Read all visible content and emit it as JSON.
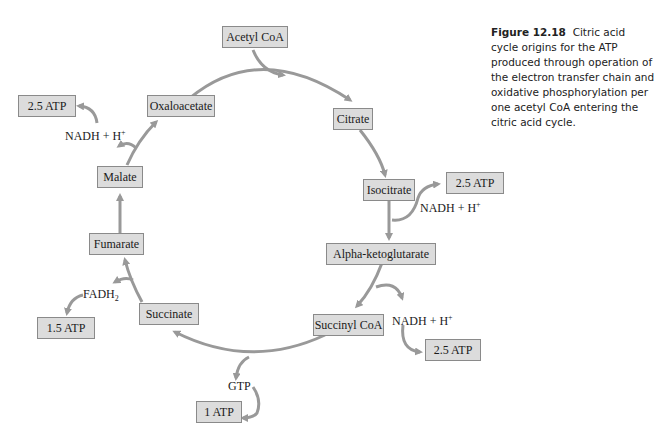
{
  "figure": {
    "number": "Figure 12.18",
    "caption": "Citric acid cycle origins for the ATP produced through operation of the electron transfer chain and oxidative phosphorylation per one acetyl CoA entering the citric acid cycle."
  },
  "cycle": {
    "entry": "Acetyl CoA",
    "intermediates": [
      "Citrate",
      "Isocitrate",
      "Alpha-ketoglutarate",
      "Succinyl CoA",
      "Succinate",
      "Fumarate",
      "Malate",
      "Oxaloacetate"
    ]
  },
  "outputs": {
    "isocitrate": {
      "carrier": "NADH + H",
      "carrier_sup": "+",
      "atp": "2.5 ATP"
    },
    "alpha_kg": {
      "carrier": "NADH + H",
      "carrier_sup": "+",
      "atp": "2.5 ATP"
    },
    "succinyl_coa": {
      "carrier": "GTP",
      "atp": "1 ATP"
    },
    "succinate": {
      "carrier": "FADH",
      "carrier_sub": "2",
      "atp": "1.5 ATP"
    },
    "malate": {
      "carrier": "NADH + H",
      "carrier_sup": "+",
      "atp": "2.5 ATP"
    }
  },
  "colors": {
    "arrow": "#999999",
    "box_fill": "#dcdcdc",
    "box_border": "#8a8a8a"
  }
}
